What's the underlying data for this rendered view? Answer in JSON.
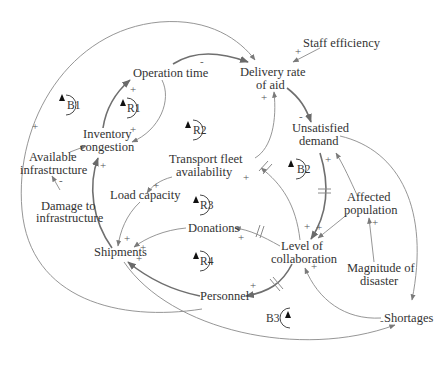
{
  "diagram": {
    "type": "causal-loop-diagram",
    "nodes": {
      "operation_time": "Operation time",
      "delivery_rate_1": "Delivery rate",
      "delivery_rate_2": "of aid",
      "staff_efficiency": "Staff efficiency",
      "unsatisfied_1": "Unsatisfied",
      "unsatisfied_2": "demand",
      "inventory_1": "Inventory",
      "inventory_2": "congestion",
      "available_1": "Available",
      "available_2": "infrastructure",
      "damage_1": "Damage to",
      "damage_2": "infrastructure",
      "transport_1": "Transport fleet",
      "transport_2": "availability",
      "load_capacity": "Load capacity",
      "affected_1": "Affected",
      "affected_2": "population",
      "donations": "Donations",
      "shipments": "Shipments",
      "collab_1": "Level of",
      "collab_2": "collaboration",
      "magnitude_1": "Magnitude of",
      "magnitude_2": "disaster",
      "personnel": "Personnel",
      "shortages": "Shortages"
    },
    "loops": {
      "b1": "B1",
      "r1": "R1",
      "r2": "R2",
      "b2": "B2",
      "r3": "R3",
      "r4": "R4",
      "b3": "B3"
    },
    "signs": {
      "plus": "+",
      "minus": "-"
    },
    "links": [
      {
        "from": "Operation time",
        "to": "Delivery rate of aid",
        "polarity": "-"
      },
      {
        "from": "Staff efficiency",
        "to": "Delivery rate of aid",
        "polarity": "+"
      },
      {
        "from": "Delivery rate of aid",
        "to": "Unsatisfied demand",
        "polarity": "-"
      },
      {
        "from": "Inventory congestion",
        "to": "Operation time",
        "polarity": "+"
      },
      {
        "from": "Operation time",
        "to": "Inventory congestion",
        "polarity": "+"
      },
      {
        "from": "Available infrastructure",
        "to": "Inventory congestion",
        "polarity": "-"
      },
      {
        "from": "Damage to infrastructure",
        "to": "Available infrastructure",
        "polarity": "-"
      },
      {
        "from": "Available infrastructure",
        "to": "Delivery rate of aid",
        "polarity": "+"
      },
      {
        "from": "Shipments",
        "to": "Inventory congestion",
        "polarity": "+"
      },
      {
        "from": "Transport fleet availability",
        "to": "Delivery rate of aid",
        "polarity": "+"
      },
      {
        "from": "Transport fleet availability",
        "to": "Load capacity",
        "polarity": "+"
      },
      {
        "from": "Load capacity",
        "to": "Shipments",
        "polarity": "+"
      },
      {
        "from": "Level of collaboration",
        "to": "Transport fleet availability",
        "polarity": "+",
        "delay": true
      },
      {
        "from": "Unsatisfied demand",
        "to": "Level of collaboration",
        "polarity": "+",
        "delay": true
      },
      {
        "from": "Affected population",
        "to": "Unsatisfied demand",
        "polarity": "+"
      },
      {
        "from": "Affected population",
        "to": "Level of collaboration",
        "polarity": "+"
      },
      {
        "from": "Magnitude of disaster",
        "to": "Affected population",
        "polarity": "+"
      },
      {
        "from": "Level of collaboration",
        "to": "Donations",
        "polarity": "+",
        "delay": true
      },
      {
        "from": "Donations",
        "to": "Shipments",
        "polarity": "+"
      },
      {
        "from": "Level of collaboration",
        "to": "Personnel",
        "polarity": "+",
        "delay": true
      },
      {
        "from": "Personnel",
        "to": "Shipments",
        "polarity": "+"
      },
      {
        "from": "Unsatisfied demand",
        "to": "Shortages",
        "polarity": "+"
      },
      {
        "from": "Shortages",
        "to": "Level of collaboration",
        "polarity": "+"
      },
      {
        "from": "Shipments",
        "to": "Shortages",
        "polarity": "-"
      },
      {
        "from": "Personnel",
        "to": "Delivery rate of aid",
        "polarity": "+"
      }
    ]
  }
}
